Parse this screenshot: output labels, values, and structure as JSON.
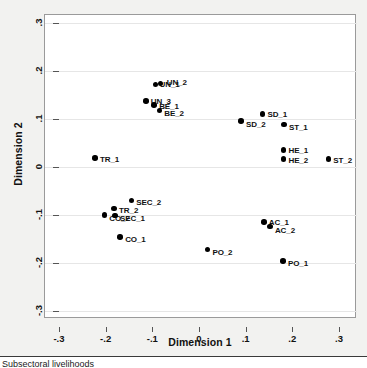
{
  "chart_data": {
    "type": "scatter",
    "title": "",
    "xlabel": "Dimension 1",
    "ylabel": "Dimension 2",
    "xlim": [
      -0.3,
      0.3
    ],
    "ylim": [
      -0.3,
      0.3
    ],
    "xticks": [
      -0.3,
      -0.2,
      -0.1,
      0,
      0.1,
      0.2,
      0.3
    ],
    "xtick_labels": [
      "-.3",
      "-.2",
      "-.1",
      "0",
      ".1",
      ".2",
      ".3"
    ],
    "yticks": [
      0.3,
      0.2,
      0.1,
      0,
      -0.1,
      -0.2,
      -0.3
    ],
    "ytick_labels": [
      ".3",
      ".2",
      ".1",
      "0",
      "-.1",
      "-.2",
      "-.3"
    ],
    "grid": "horizontal",
    "legend": "none",
    "marker": "filled-circle",
    "marker_color": "#000000",
    "points": [
      {
        "label": "UN_1",
        "x": -0.093,
        "y": 0.172,
        "lx": 4,
        "ly": -4
      },
      {
        "label": "UN_2",
        "x": -0.082,
        "y": 0.174,
        "lx": 6,
        "ly": -5
      },
      {
        "label": "UN_3",
        "x": -0.114,
        "y": 0.138,
        "lx": 5,
        "ly": -4
      },
      {
        "label": "BE_1",
        "x": -0.096,
        "y": 0.129,
        "lx": 5,
        "ly": -3
      },
      {
        "label": "BE_2",
        "x": -0.085,
        "y": 0.118,
        "lx": 5,
        "ly": -1
      },
      {
        "label": "SD_1",
        "x": 0.136,
        "y": 0.11,
        "lx": 5,
        "ly": -4
      },
      {
        "label": "SD_2",
        "x": 0.09,
        "y": 0.096,
        "lx": 5,
        "ly": -1
      },
      {
        "label": "ST_1",
        "x": 0.182,
        "y": 0.089,
        "lx": 5,
        "ly": -1
      },
      {
        "label": "HE_1",
        "x": 0.181,
        "y": 0.035,
        "lx": 5,
        "ly": -4
      },
      {
        "label": "HE_2",
        "x": 0.181,
        "y": 0.017,
        "lx": 5,
        "ly": -3
      },
      {
        "label": "ST_2",
        "x": 0.277,
        "y": 0.017,
        "lx": 5,
        "ly": -3
      },
      {
        "label": "TR_1",
        "x": -0.223,
        "y": 0.019,
        "lx": 5,
        "ly": -3
      },
      {
        "label": "SEC_2",
        "x": -0.145,
        "y": -0.07,
        "lx": 5,
        "ly": -3
      },
      {
        "label": "TR_2",
        "x": -0.182,
        "y": -0.086,
        "lx": 5,
        "ly": -2
      },
      {
        "label": "CO_2",
        "x": -0.203,
        "y": -0.1,
        "lx": 5,
        "ly": -1
      },
      {
        "label": "SEC_1",
        "x": -0.18,
        "y": -0.101,
        "lx": 5,
        "ly": -1
      },
      {
        "label": "CO_1",
        "x": -0.169,
        "y": -0.146,
        "lx": 5,
        "ly": -2
      },
      {
        "label": "AC_1",
        "x": 0.139,
        "y": -0.115,
        "lx": 5,
        "ly": -4
      },
      {
        "label": "AC_2",
        "x": 0.152,
        "y": -0.124,
        "lx": 5,
        "ly": -1
      },
      {
        "label": "PO_2",
        "x": 0.018,
        "y": -0.172,
        "lx": 5,
        "ly": -2
      },
      {
        "label": "PO_1",
        "x": 0.18,
        "y": -0.196,
        "lx": 5,
        "ly": -2
      }
    ]
  },
  "caption": {
    "text": "Subsectoral livelihoods"
  }
}
